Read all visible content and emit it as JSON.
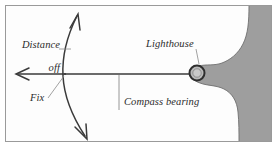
{
  "figure": {
    "name": "coastal-navigation-fix-diagram",
    "width": 278,
    "height": 147,
    "background_color": "#ffffff",
    "border_color": "#9a9a9a",
    "land_fill_color": "#9e9e9e",
    "land_stroke_color": "#6f6f6f",
    "line_color": "#3a3a3a",
    "leader_color": "#6b6b6b"
  },
  "labels": {
    "distance_off_line1": "Distance",
    "distance_off_line2": "off",
    "fix": "Fix",
    "compass_bearing": "Compass bearing",
    "lighthouse": "Lighthouse"
  },
  "elements": {
    "bearing_line_name": "compass-bearing-line",
    "position_arc_name": "distance-off-position-arc",
    "fix_point_name": "fix-point",
    "lighthouse_symbol_name": "lighthouse-symbol",
    "coastline_name": "coastline-landmass"
  }
}
